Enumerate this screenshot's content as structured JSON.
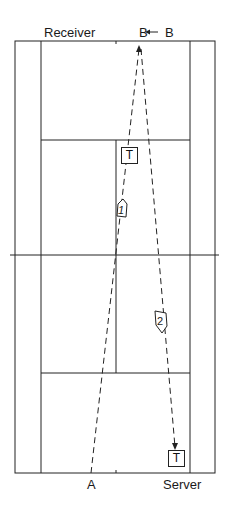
{
  "labels": {
    "receiver": "Receiver",
    "server": "Server",
    "b_from": "B",
    "b_to": "B",
    "a": "A",
    "target_top": "T",
    "target_bottom": "T",
    "shot1": "1",
    "shot2": "2"
  },
  "colors": {
    "lines": "#222222",
    "background": "#ffffff"
  }
}
